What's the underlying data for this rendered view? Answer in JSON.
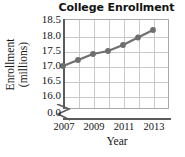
{
  "chart_data": {
    "type": "line",
    "title": "College Enrollment",
    "xlabel": "Year",
    "ylabel_line1": "Enrollment",
    "ylabel_line2": "(millions)",
    "x": [
      2007,
      2008,
      2009,
      2010,
      2011,
      2012,
      2013
    ],
    "values": [
      17.0,
      17.2,
      17.4,
      17.5,
      17.7,
      17.95,
      18.2
    ],
    "xtick_labels": [
      "2007",
      "2009",
      "2011",
      "2013"
    ],
    "xtick_values": [
      2007,
      2009,
      2011,
      2013
    ],
    "ytick_labels": [
      "18.5",
      "18.0",
      "17.5",
      "17.0",
      "16.5",
      "16.0",
      "0.0"
    ],
    "ytick_values": [
      18.5,
      18.0,
      17.5,
      17.0,
      16.5,
      16.0,
      0.0
    ],
    "ylim": [
      16.0,
      18.5
    ],
    "xlim": [
      2006.5,
      2013.5
    ],
    "axis_break": true,
    "axis_break_between": [
      0.0,
      16.0
    ],
    "grid": true,
    "legend": "none",
    "marker": "circle",
    "line_color": "#6e6e6e",
    "marker_color": "#6e6e6e",
    "grid_color": "#c9c9c9",
    "axis_color": "#5b5b5b",
    "text_color": "#131313"
  }
}
